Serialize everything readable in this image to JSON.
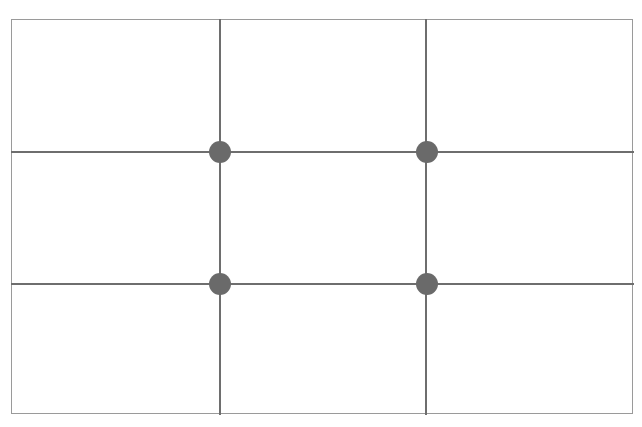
{
  "diagram": {
    "type": "rule-of-thirds-grid",
    "frame": {
      "left": 11,
      "top": 19,
      "right": 634,
      "bottom": 415
    },
    "vertical_lines_x": [
      220,
      426
    ],
    "horizontal_lines_y": [
      152,
      284
    ],
    "intersection_points": [
      {
        "x": 220,
        "y": 152
      },
      {
        "x": 427,
        "y": 152
      },
      {
        "x": 220,
        "y": 284
      },
      {
        "x": 427,
        "y": 284
      }
    ],
    "colors": {
      "line": "#6e6e6e",
      "border": "#9a9a9a",
      "dot": "#6a6a6a",
      "background": "#ffffff"
    }
  }
}
